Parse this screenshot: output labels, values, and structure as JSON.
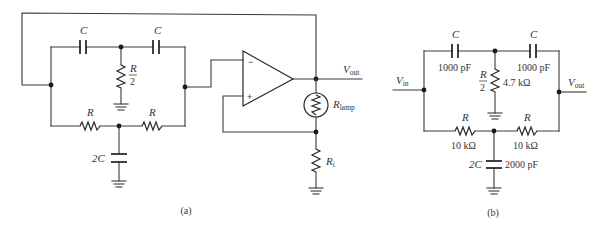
{
  "figure": {
    "caption_a": "(a)",
    "caption_b": "(b)"
  },
  "circuit_a": {
    "description": "Twin-T oscillator with op-amp and lamp-stabilized gain",
    "cap_top_left": "C",
    "cap_top_right": "C",
    "res_shunt_num": "R",
    "res_shunt_den": "2",
    "res_bottom_left": "R",
    "res_bottom_right": "R",
    "cap_shunt": "2C",
    "opamp_minus": "−",
    "opamp_plus": "+",
    "vout_main": "V",
    "vout_sub": "out",
    "lamp_main": "R",
    "lamp_sub": "lamp",
    "ri_main": "R",
    "ri_sub": "i"
  },
  "circuit_b": {
    "description": "Twin-T notch filter with component values",
    "vin_main": "V",
    "vin_sub": "in",
    "vout_main": "V",
    "vout_sub": "out",
    "cap_top_left": "C",
    "cap_top_left_value": "1000 pF",
    "cap_top_right": "C",
    "cap_top_right_value": "1000 pF",
    "res_shunt_num": "R",
    "res_shunt_den": "2",
    "res_shunt_value": "4.7 kΩ",
    "res_bottom_left": "R",
    "res_bottom_left_value": "10 kΩ",
    "res_bottom_right": "R",
    "res_bottom_right_value": "10 kΩ",
    "cap_shunt": "2C",
    "cap_shunt_value": "2000 pF"
  }
}
